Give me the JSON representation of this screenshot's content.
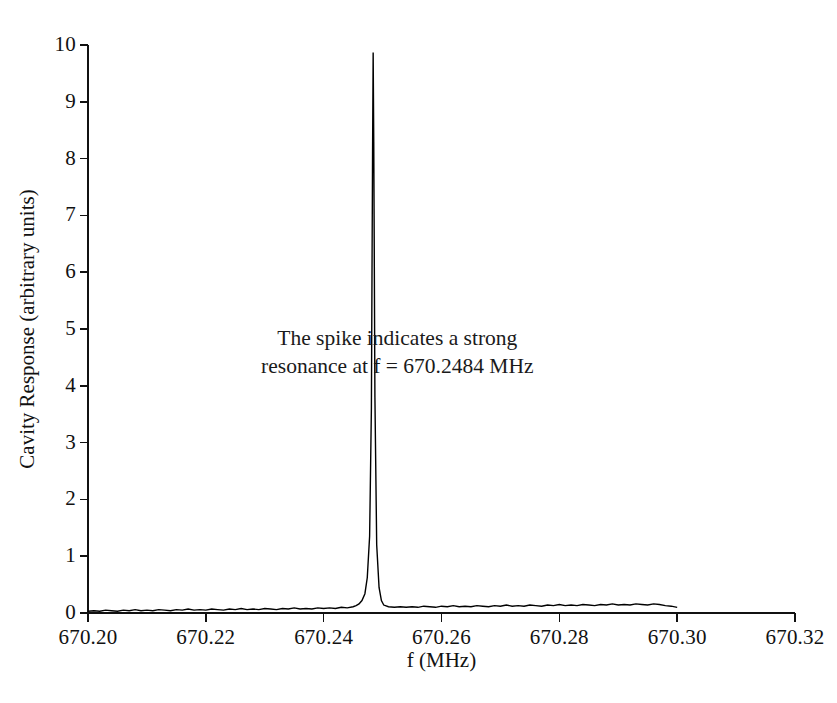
{
  "figure": {
    "background": "#ffffff",
    "ink_color": "#111111"
  },
  "chart_data": {
    "type": "line",
    "title": "",
    "xlabel": "f (MHz)",
    "ylabel": "Cavity Response (arbitrary units)",
    "xlim": [
      670.2,
      670.32
    ],
    "ylim": [
      0,
      10
    ],
    "xticks": [
      670.2,
      670.22,
      670.24,
      670.26,
      670.28,
      670.3,
      670.32
    ],
    "xtick_labels": [
      "670.20",
      "670.22",
      "670.24",
      "670.26",
      "670.28",
      "670.30",
      "670.32"
    ],
    "yticks": [
      0,
      1,
      2,
      3,
      4,
      5,
      6,
      7,
      8,
      9,
      10
    ],
    "ytick_labels": [
      "0",
      "1",
      "2",
      "3",
      "4",
      "5",
      "6",
      "7",
      "8",
      "9",
      "10"
    ],
    "grid": false,
    "legend": null,
    "line_color": "#000000",
    "line_width": 1.4,
    "peak": {
      "frequency_mhz": 670.2484,
      "height": 9.87,
      "half_width_mhz": 0.00022
    },
    "series": [
      {
        "name": "Cavity response",
        "x": [
          670.2,
          670.201,
          670.202,
          670.203,
          670.204,
          670.205,
          670.206,
          670.207,
          670.208,
          670.209,
          670.21,
          670.211,
          670.212,
          670.213,
          670.214,
          670.215,
          670.216,
          670.217,
          670.218,
          670.219,
          670.22,
          670.221,
          670.222,
          670.223,
          670.224,
          670.225,
          670.226,
          670.227,
          670.228,
          670.229,
          670.23,
          670.231,
          670.232,
          670.233,
          670.234,
          670.235,
          670.236,
          670.237,
          670.238,
          670.239,
          670.24,
          670.241,
          670.242,
          670.243,
          670.244,
          670.245,
          670.2455,
          670.246,
          670.2465,
          670.247,
          670.2474,
          670.2478,
          670.2481,
          670.2482,
          670.2483,
          670.2484,
          670.2485,
          670.2486,
          670.2487,
          670.249,
          670.2494,
          670.2498,
          670.2502,
          670.251,
          670.252,
          670.253,
          670.254,
          670.255,
          670.256,
          670.257,
          670.258,
          670.259,
          670.26,
          670.261,
          670.262,
          670.263,
          670.264,
          670.265,
          670.266,
          670.267,
          670.268,
          670.269,
          670.27,
          670.271,
          670.272,
          670.273,
          670.274,
          670.275,
          670.276,
          670.277,
          670.278,
          670.279,
          670.28,
          670.281,
          670.282,
          670.283,
          670.284,
          670.285,
          670.286,
          670.287,
          670.288,
          670.289,
          670.29,
          670.291,
          670.292,
          670.293,
          670.294,
          670.295,
          670.296,
          670.297,
          670.298,
          670.299,
          670.3
        ],
        "y": [
          0.03,
          0.04,
          0.03,
          0.05,
          0.04,
          0.03,
          0.05,
          0.04,
          0.06,
          0.04,
          0.05,
          0.04,
          0.06,
          0.05,
          0.04,
          0.06,
          0.05,
          0.07,
          0.05,
          0.06,
          0.05,
          0.07,
          0.06,
          0.05,
          0.07,
          0.06,
          0.08,
          0.06,
          0.07,
          0.06,
          0.08,
          0.07,
          0.06,
          0.08,
          0.07,
          0.09,
          0.07,
          0.08,
          0.07,
          0.09,
          0.08,
          0.09,
          0.08,
          0.1,
          0.09,
          0.11,
          0.13,
          0.16,
          0.22,
          0.34,
          0.62,
          1.35,
          3.6,
          5.9,
          8.1,
          9.87,
          8.3,
          6.1,
          3.8,
          1.2,
          0.45,
          0.22,
          0.14,
          0.11,
          0.1,
          0.11,
          0.1,
          0.11,
          0.1,
          0.12,
          0.11,
          0.1,
          0.12,
          0.11,
          0.13,
          0.11,
          0.12,
          0.11,
          0.13,
          0.12,
          0.11,
          0.13,
          0.12,
          0.14,
          0.12,
          0.13,
          0.12,
          0.14,
          0.13,
          0.12,
          0.14,
          0.13,
          0.15,
          0.13,
          0.14,
          0.13,
          0.15,
          0.14,
          0.13,
          0.15,
          0.14,
          0.16,
          0.14,
          0.15,
          0.14,
          0.16,
          0.15,
          0.14,
          0.16,
          0.15,
          0.13,
          0.12,
          0.1
        ]
      }
    ],
    "annotation": {
      "lines": [
        "The spike indicates a strong",
        "resonance at f = 670.2484 MHz"
      ],
      "x": 670.2525,
      "y": 4.6
    }
  }
}
